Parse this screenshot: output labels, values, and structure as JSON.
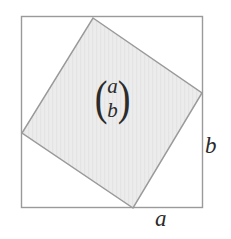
{
  "figure": {
    "background_color": "#ffffff",
    "outer_square": {
      "name": "outer-square",
      "stroke_color": "#9a9a9a",
      "fill_color": "none",
      "stroke_width": 1.4,
      "x": 21,
      "y": 16,
      "width": 182,
      "height": 192,
      "side_labels": {
        "bottom": "a",
        "right": "b"
      }
    },
    "inner_square": {
      "name": "rotated-inner-square",
      "stroke_color": "#9a9a9a",
      "fill_color": "#ececec",
      "stroke_width": 1.4,
      "vertices": [
        {
          "label": "top",
          "x": 93,
          "y": 18
        },
        {
          "label": "right",
          "x": 202,
          "y": 93
        },
        {
          "label": "bottom",
          "x": 133,
          "y": 208
        },
        {
          "label": "left",
          "x": 22,
          "y": 133
        }
      ]
    },
    "vector_label": {
      "name": "column-vector",
      "open_paren": "(",
      "close_paren": ")",
      "components": [
        "a",
        "b"
      ]
    },
    "labels": {
      "bottom_label": "a",
      "right_label": "b"
    }
  }
}
